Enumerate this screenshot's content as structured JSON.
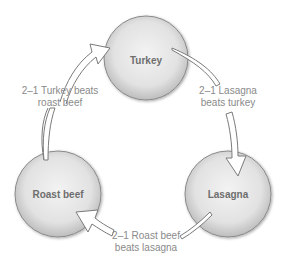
{
  "diagram": {
    "type": "cycle",
    "nodes": [
      {
        "id": "turkey",
        "label": "Turkey"
      },
      {
        "id": "roast_beef",
        "label": "Roast beef"
      },
      {
        "id": "lasagna",
        "label": "Lasagna"
      }
    ],
    "edges": [
      {
        "from": "roast_beef",
        "to": "turkey",
        "label_line1": "2–1 Turkey beats",
        "label_line2": "roast beef"
      },
      {
        "from": "turkey",
        "to": "lasagna",
        "label_line1": "2–1 Lasagna",
        "label_line2": "beats turkey"
      },
      {
        "from": "lasagna",
        "to": "roast_beef",
        "label_line1": "2–1 Roast beef",
        "label_line2": "beats lasagna"
      }
    ],
    "colors": {
      "node_fill_center": "#f2f2f2",
      "node_fill_edge": "#cfcfcf",
      "node_stroke": "#8a8a8a",
      "text": "#7a7a7a",
      "arrow_fill": "#ffffff"
    }
  }
}
